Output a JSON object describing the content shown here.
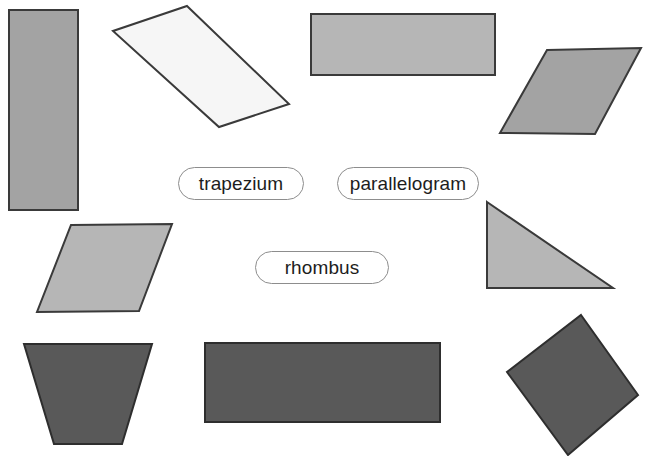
{
  "page": {
    "background_color": "#ffffff",
    "width": 650,
    "height": 456
  },
  "palette": {
    "outline": "#3a3a3a",
    "medium_gray": "#a3a3a3",
    "light_gray": "#b6b6b6",
    "dark_gray": "#595959",
    "white_fill": "#f6f6f6",
    "pill_border": "#8d8d8d",
    "pill_fill": "#ffffff",
    "text": "#1d1d1d"
  },
  "labels": [
    {
      "id": "trapezium",
      "text": "trapezium",
      "x": 178,
      "y": 167,
      "width": 126,
      "height": 33
    },
    {
      "id": "parallelogram",
      "text": "parallelogram",
      "x": 337,
      "y": 167,
      "width": 142,
      "height": 33
    },
    {
      "id": "rhombus",
      "text": "rhombus",
      "x": 255,
      "y": 251,
      "width": 134,
      "height": 33
    }
  ],
  "shapes": [
    {
      "id": "tall-rectangle",
      "kind": "rectangle",
      "fill": "#a3a3a3",
      "stroke": "#3a3a3a",
      "stroke_width": 2,
      "points": "9,10 78,10 78,210 9,210"
    },
    {
      "id": "white-parallelogram",
      "kind": "parallelogram",
      "fill": "#f6f6f6",
      "stroke": "#3a3a3a",
      "stroke_width": 2,
      "points": "187,6 289,104 219,127 113,31"
    },
    {
      "id": "top-rectangle",
      "kind": "rectangle",
      "fill": "#b6b6b6",
      "stroke": "#3a3a3a",
      "stroke_width": 2,
      "points": "311,14 495,14 495,75 311,75"
    },
    {
      "id": "top-right-parallelogram",
      "kind": "parallelogram",
      "fill": "#a3a3a3",
      "stroke": "#3a3a3a",
      "stroke_width": 2,
      "points": "547,50 641,48 595,134 500,133"
    },
    {
      "id": "left-parallelogram",
      "kind": "parallelogram",
      "fill": "#b6b6b6",
      "stroke": "#3a3a3a",
      "stroke_width": 2,
      "points": "71,225 172,224 139,311 37,312"
    },
    {
      "id": "right-triangle",
      "kind": "triangle",
      "fill": "#b6b6b6",
      "stroke": "#3a3a3a",
      "stroke_width": 2,
      "points": "487,202 613,288 487,288"
    },
    {
      "id": "trapezoid",
      "kind": "trapezoid",
      "fill": "#595959",
      "stroke": "#2e2e2e",
      "stroke_width": 2,
      "points": "24,344 152,344 122,444 54,444"
    },
    {
      "id": "bottom-rectangle",
      "kind": "rectangle",
      "fill": "#595959",
      "stroke": "#2e2e2e",
      "stroke_width": 2,
      "points": "205,343 440,343 440,422 205,422"
    },
    {
      "id": "rotated-square",
      "kind": "square",
      "fill": "#595959",
      "stroke": "#2e2e2e",
      "stroke_width": 2,
      "points": "581,315 638,395 568,455 507,372"
    }
  ]
}
